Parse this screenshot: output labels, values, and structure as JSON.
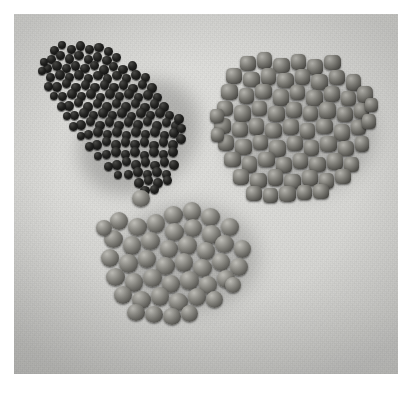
{
  "image": {
    "kind": "photograph",
    "subject": "three separated piles of extruded feed pellets on a light cloth surface",
    "rendering": "grayscale / desaturated",
    "border_color": "#ffffff",
    "background_color": "#d9d9d6"
  },
  "frame": {
    "border_label": "white photo border",
    "plate_left": 14,
    "plate_top": 14,
    "plate_width": 384,
    "plate_height": 360
  },
  "piles": [
    {
      "id": "pile-dark",
      "label": "dark pellets pile",
      "position": "upper-left",
      "shape": "elongated teardrop angled down-right",
      "pellet_shape": "small rounded granules",
      "pellet_size_px": 9,
      "approx_count": 150,
      "color_light": "#4a4a47",
      "color_mid": "#232321",
      "color_dark": "#0a0a0a",
      "bounds": {
        "x": 48,
        "y": 44,
        "w": 136,
        "h": 130
      }
    },
    {
      "id": "pile-medium",
      "label": "large cylindrical pellets pile",
      "position": "upper-right",
      "shape": "broad rounded heap",
      "pellet_shape": "short cylinders with flat cut ends",
      "pellet_size_px": 17,
      "approx_count": 72,
      "color_light": "#b4b3ad",
      "color_mid": "#7a7973",
      "color_dark": "#343330",
      "bounds": {
        "x": 212,
        "y": 52,
        "w": 148,
        "h": 136
      }
    },
    {
      "id": "pile-round",
      "label": "round pellets pile",
      "position": "lower-center",
      "shape": "compact rounded heap with one stray granule above-left",
      "pellet_shape": "spherical / barrel granules",
      "pellet_size_px": 19,
      "approx_count": 46,
      "color_light": "#bfbeb8",
      "color_mid": "#83827c",
      "color_dark": "#3a3936",
      "bounds": {
        "x": 106,
        "y": 186,
        "w": 140,
        "h": 122
      }
    }
  ],
  "lighting": {
    "direction": "upper-left",
    "shadow_direction": "lower-right",
    "shadow_color": "rgba(0,0,0,0.22)"
  },
  "text_content": {
    "has_text": "false",
    "captions": []
  }
}
